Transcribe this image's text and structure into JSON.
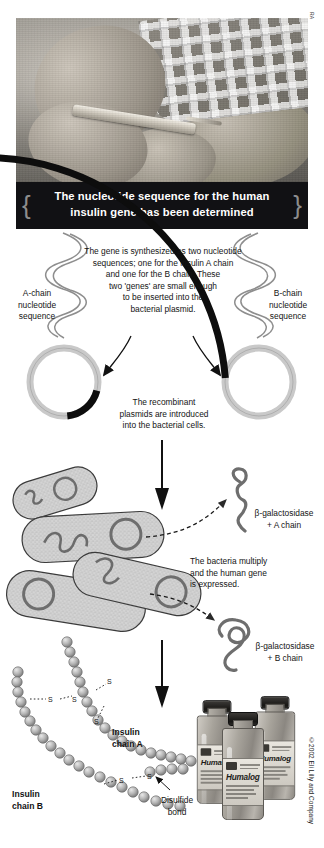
{
  "page": {
    "photo_credit": "RA",
    "copyright": "©2002 Eli Lilly and Company"
  },
  "banner": {
    "line1": "The nucleotide sequence for the human",
    "line2": "insulin gene has been determined",
    "bg_color": "#111114",
    "text_color": "#ffffff"
  },
  "step_synthesis": {
    "paragraph": [
      "The gene is synthesized as two nucleotide",
      "sequences; one for the insulin A chain",
      "and one for the B chain. These",
      "two 'genes' are small enough",
      "to be inserted into the",
      "bacterial plasmid."
    ],
    "left_label": [
      "A-chain",
      "nucleotide",
      "sequence"
    ],
    "right_label": [
      "B-chain",
      "nucleotide",
      "sequence"
    ]
  },
  "step_plasmid": {
    "paragraph": [
      "The recombinant",
      "plasmids are introduced",
      "into the bacterial cells."
    ],
    "ring_color": "#c9c9c9",
    "insert_color": "#0d0d0d"
  },
  "step_bacteria": {
    "paragraph": [
      "The bacteria multiply",
      "and the human gene",
      "is expressed."
    ],
    "product_a": [
      "β-galactosidase",
      "+ A chain"
    ],
    "product_b": [
      "β-galactosidase",
      "+ B chain"
    ],
    "cell_fill": "#d2d2d2"
  },
  "step_insulin": {
    "chain_a_label": [
      "Insulin",
      "chain A"
    ],
    "chain_b_label": [
      "Insulin",
      "chain B"
    ],
    "bond_label": [
      "Disulfide",
      "bond"
    ],
    "sulfur_symbol": "S",
    "bead_color": "#b9b9b9"
  },
  "product": {
    "brand": "Humalog",
    "brand_superscript": "®",
    "vial_count": 3
  }
}
